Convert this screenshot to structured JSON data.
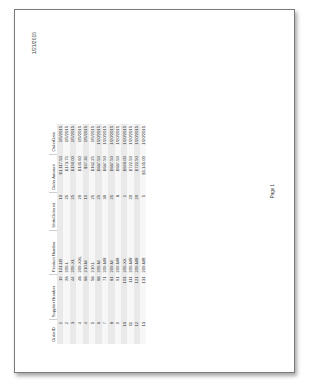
{
  "header": {
    "date": "1/21/2015"
  },
  "report": {
    "title": "Orders"
  },
  "table": {
    "columns": [
      "OrderID",
      "Supplier Number",
      "Product Number",
      "UnitsOrdered",
      "Order Amount",
      "OrderDate"
    ],
    "rows": [
      [
        "1",
        "19",
        "101-LB",
        "10",
        "$1,117.50",
        "1/5/2015"
      ],
      [
        "2",
        "28",
        "209-L",
        "25",
        "$173.75",
        "1/5/2015"
      ],
      [
        "3",
        "44",
        "209-XL",
        "25",
        "$190.00",
        "1/5/2015"
      ],
      [
        "4",
        "48",
        "209-XXL",
        "20",
        "$145.60",
        "1/5/2015"
      ],
      [
        "4",
        "68",
        "210-M",
        "15",
        "$97.35",
        "1/5/2015"
      ],
      [
        "5",
        "58",
        "210-L",
        "25",
        "$162.25",
        "1/5/2015"
      ],
      [
        "6",
        "68",
        "209-M",
        "25",
        "$687.50",
        "1/20/2015"
      ],
      [
        "7",
        "71",
        "209-MR",
        "30",
        "$687.50",
        "1/20/2015"
      ],
      [
        "8",
        "81",
        "209-M",
        "25",
        "$687.50",
        "1/20/2015"
      ],
      [
        "9",
        "91",
        "209-MR",
        "8",
        "$687.50",
        "1/20/2015"
      ],
      [
        "10",
        "101",
        "209-XX",
        "1",
        "$690.00",
        "1/20/2015"
      ],
      [
        "11",
        "111",
        "209-MR",
        "20",
        "$722.50",
        "1/20/2015"
      ],
      [
        "12",
        "121",
        "209-MR",
        "20",
        "$722.50",
        "1/20/2015"
      ],
      [
        "13",
        "131",
        "209-MR",
        "5",
        "$1,145.00",
        "1/20/2015"
      ]
    ]
  },
  "footer": {
    "page_label": "Page 1"
  }
}
